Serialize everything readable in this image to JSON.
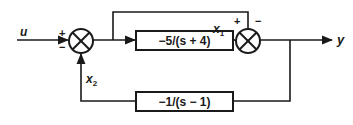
{
  "diagram": {
    "type": "block-diagram",
    "input": {
      "label": "u"
    },
    "output": {
      "label": "y"
    },
    "summing_junctions": [
      {
        "id": "sum1",
        "signs": {
          "top_left": "+",
          "bottom_left": "−"
        }
      },
      {
        "id": "sum2",
        "signs": {
          "top_left": "+",
          "top_right": "−"
        }
      }
    ],
    "blocks": [
      {
        "id": "forward",
        "transfer_function": "−5/(s + 4)",
        "output_signal": "x₁"
      },
      {
        "id": "feedback",
        "transfer_function": "−1/(s − 1)",
        "output_signal": "x₂"
      }
    ],
    "signals": {
      "x1": {
        "name": "x",
        "subscript": "1"
      },
      "x2": {
        "name": "x",
        "subscript": "2"
      }
    },
    "connections": [
      "u → sum1 (+)",
      "sum1 → forward block",
      "sum1 output → sum2 (+) via top bypass",
      "forward block (x₁) → sum2 (−)",
      "sum2 → y",
      "y → feedback block",
      "feedback block (x₂) → sum1 (−)"
    ]
  },
  "colors": {
    "stroke": "#1a1a1a",
    "background": "#ffffff"
  }
}
